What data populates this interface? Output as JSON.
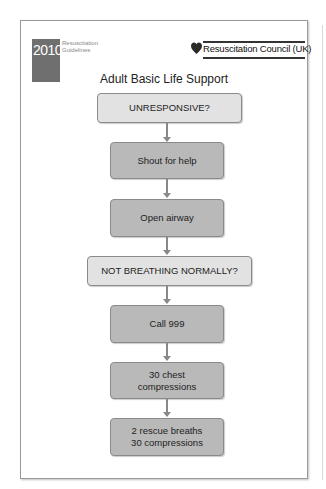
{
  "header": {
    "badge_year": "2010",
    "badge_subtitle_line1": "Resuscitation",
    "badge_subtitle_line2": "Guidelines",
    "logo_text": "Resuscitation Council (UK)",
    "logo_icon": "heart-icon"
  },
  "title": "Adult Basic Life Support",
  "flow": {
    "steps": [
      {
        "type": "question",
        "lines": [
          "UNRESPONSIVE?"
        ]
      },
      {
        "type": "action",
        "lines": [
          "Shout for help"
        ]
      },
      {
        "type": "action",
        "lines": [
          "Open airway"
        ]
      },
      {
        "type": "question",
        "lines": [
          "NOT BREATHING NORMALLY?"
        ]
      },
      {
        "type": "action",
        "lines": [
          "Call 999"
        ]
      },
      {
        "type": "action",
        "lines": [
          "30 chest",
          "compressions"
        ]
      },
      {
        "type": "action",
        "lines": [
          "2 rescue breaths",
          "30 compressions"
        ]
      }
    ]
  },
  "colors": {
    "question_box": "#e2e2e2",
    "action_box": "#b9b9b9",
    "badge": "#6f6f6f",
    "heart": "#2a2a2a",
    "arrow": "#888888"
  }
}
